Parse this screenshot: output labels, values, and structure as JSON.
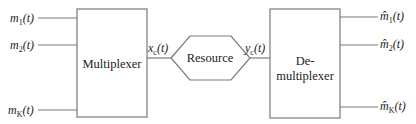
{
  "diagram": {
    "type": "block-diagram",
    "colors": {
      "stroke": "#7a7a7a",
      "text": "#222222",
      "background": "#ffffff"
    },
    "inputs": [
      {
        "base": "m",
        "sub": "1",
        "arg": "(t)"
      },
      {
        "base": "m",
        "sub": "2",
        "arg": "(t)"
      },
      {
        "base": "m",
        "sub": "K",
        "arg": "(t)"
      }
    ],
    "multiplexer": {
      "label": "Multiplexer"
    },
    "channel_in": {
      "base": "x",
      "sub": "c",
      "arg": "(t)"
    },
    "resource": {
      "label": "Resource"
    },
    "channel_out": {
      "base": "y",
      "sub": "c",
      "arg": "(t)"
    },
    "demultiplexer": {
      "label_line1": "De-",
      "label_line2": "multiplexer"
    },
    "outputs": [
      {
        "base": "m̂",
        "sub": "1",
        "arg": "(t)"
      },
      {
        "base": "m̂",
        "sub": "2",
        "arg": "(t)"
      },
      {
        "base": "m̂",
        "sub": "K",
        "arg": "(t)"
      }
    ]
  }
}
